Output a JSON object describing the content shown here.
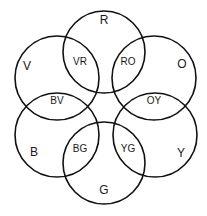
{
  "diagram": {
    "type": "color-wheel-venn",
    "circles": [
      {
        "id": "R",
        "label": "R",
        "cx": 104,
        "cy": 52,
        "r": 41,
        "lx": 104,
        "ly": 21
      },
      {
        "id": "V",
        "label": "V",
        "cx": 57,
        "cy": 78,
        "r": 42,
        "lx": 27,
        "ly": 67
      },
      {
        "id": "O",
        "label": "O",
        "cx": 154,
        "cy": 78,
        "r": 42,
        "lx": 182,
        "ly": 65
      },
      {
        "id": "B",
        "label": "B",
        "cx": 57,
        "cy": 135,
        "r": 42,
        "lx": 34,
        "ly": 153
      },
      {
        "id": "Y",
        "label": "Y",
        "cx": 155,
        "cy": 135,
        "r": 42,
        "lx": 181,
        "ly": 154
      },
      {
        "id": "G",
        "label": "G",
        "cx": 104,
        "cy": 163,
        "r": 41,
        "lx": 104,
        "ly": 191
      }
    ],
    "intersections": [
      {
        "id": "VR",
        "label": "VR",
        "x": 80,
        "y": 62
      },
      {
        "id": "RO",
        "label": "RO",
        "x": 128,
        "y": 62
      },
      {
        "id": "BV",
        "label": "BV",
        "x": 57,
        "y": 101
      },
      {
        "id": "OY",
        "label": "OY",
        "x": 154,
        "y": 101
      },
      {
        "id": "BG",
        "label": "BG",
        "x": 80,
        "y": 149
      },
      {
        "id": "YG",
        "label": "YG",
        "x": 128,
        "y": 149
      }
    ],
    "stroke_color": "#111111",
    "background": "#ffffff"
  }
}
